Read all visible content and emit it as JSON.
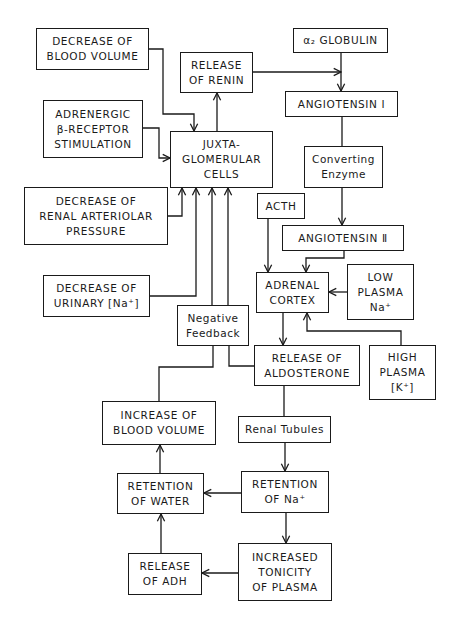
{
  "diagram": {
    "type": "flowchart",
    "nodes": {
      "decrease_blood_volume": {
        "lines": [
          "DECREASE OF",
          "BLOOD VOLUME"
        ]
      },
      "release_renin": {
        "lines": [
          "RELEASE",
          "OF RENIN"
        ]
      },
      "alpha2_globulin": {
        "lines": [
          "α₂ GLOBULIN"
        ]
      },
      "angiotensin_1": {
        "lines": [
          "ANGIOTENSIN Ⅰ"
        ]
      },
      "adrenergic": {
        "lines": [
          "ADRENERGIC",
          "β-RECEPTOR",
          "STIMULATION"
        ]
      },
      "juxtaglomerular": {
        "lines": [
          "JUXTA-",
          "GLOMERULAR",
          "CELLS"
        ]
      },
      "converting_enzyme": {
        "lines": [
          "Converting",
          "Enzyme"
        ]
      },
      "renal_arteriolar": {
        "lines": [
          "DECREASE OF",
          "RENAL ARTERIOLAR",
          "PRESSURE"
        ]
      },
      "acth": {
        "lines": [
          "ACTH"
        ]
      },
      "angiotensin_2": {
        "lines": [
          "ANGIOTENSIN Ⅱ"
        ]
      },
      "decrease_urinary_na": {
        "lines": [
          "DECREASE OF",
          "URINARY [Na⁺]"
        ]
      },
      "adrenal_cortex": {
        "lines": [
          "ADRENAL",
          "CORTEX"
        ]
      },
      "low_plasma_na": {
        "lines": [
          "LOW",
          "PLASMA",
          "Na⁺"
        ]
      },
      "negative_feedback": {
        "lines": [
          "Negative",
          "Feedback"
        ]
      },
      "release_aldosterone": {
        "lines": [
          "RELEASE OF",
          "ALDOSTERONE"
        ]
      },
      "high_plasma_k": {
        "lines": [
          "HIGH",
          "PLASMA",
          "[K⁺]"
        ]
      },
      "increase_blood_volume": {
        "lines": [
          "INCREASE OF",
          "BLOOD VOLUME"
        ]
      },
      "renal_tubules": {
        "lines": [
          "Renal Tubules"
        ]
      },
      "retention_water": {
        "lines": [
          "RETENTION",
          "OF WATER"
        ]
      },
      "retention_na": {
        "lines": [
          "RETENTION",
          "OF Na⁺"
        ]
      },
      "release_adh": {
        "lines": [
          "RELEASE",
          "OF ADH"
        ]
      },
      "increased_tonicity": {
        "lines": [
          "INCREASED",
          "TONICITY",
          "OF PLASMA"
        ]
      }
    },
    "edges": [
      {
        "from": "decrease_blood_volume",
        "to": "juxtaglomerular"
      },
      {
        "from": "adrenergic",
        "to": "juxtaglomerular"
      },
      {
        "from": "renal_arteriolar",
        "to": "juxtaglomerular"
      },
      {
        "from": "decrease_urinary_na",
        "to": "juxtaglomerular"
      },
      {
        "from": "negative_feedback",
        "to": "juxtaglomerular"
      },
      {
        "from": "release_aldosterone",
        "to": "juxtaglomerular"
      },
      {
        "from": "juxtaglomerular",
        "to": "release_renin"
      },
      {
        "from": "release_renin",
        "to": "angiotensin_1"
      },
      {
        "from": "alpha2_globulin",
        "to": "angiotensin_1"
      },
      {
        "from": "angiotensin_1",
        "to": "converting_enzyme"
      },
      {
        "from": "converting_enzyme",
        "to": "angiotensin_2"
      },
      {
        "from": "angiotensin_2",
        "to": "adrenal_cortex"
      },
      {
        "from": "acth",
        "to": "adrenal_cortex"
      },
      {
        "from": "low_plasma_na",
        "to": "adrenal_cortex"
      },
      {
        "from": "high_plasma_k",
        "to": "adrenal_cortex"
      },
      {
        "from": "adrenal_cortex",
        "to": "release_aldosterone"
      },
      {
        "from": "release_aldosterone",
        "to": "renal_tubules"
      },
      {
        "from": "renal_tubules",
        "to": "retention_na"
      },
      {
        "from": "retention_na",
        "to": "retention_water"
      },
      {
        "from": "retention_na",
        "to": "increased_tonicity"
      },
      {
        "from": "increased_tonicity",
        "to": "release_adh"
      },
      {
        "from": "release_adh",
        "to": "retention_water"
      },
      {
        "from": "retention_water",
        "to": "increase_blood_volume"
      },
      {
        "from": "increase_blood_volume",
        "to": "negative_feedback"
      }
    ]
  },
  "colors": {
    "line": "#1a1a1a",
    "background": "#ffffff"
  }
}
